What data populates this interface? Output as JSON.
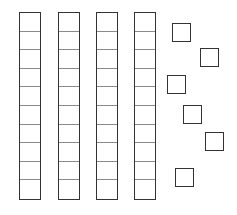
{
  "diagram": {
    "stroke_color": "#333333",
    "divider_color": "#8a8a8a",
    "rods": [
      {
        "name": "ten-rod-1",
        "left": 19,
        "cells": 10
      },
      {
        "name": "ten-rod-2",
        "left": 58,
        "cells": 10
      },
      {
        "name": "ten-rod-3",
        "left": 96,
        "cells": 10
      },
      {
        "name": "ten-rod-4",
        "left": 134,
        "cells": 10
      }
    ],
    "units": [
      {
        "name": "unit-cube-1",
        "left": 172,
        "top": 23
      },
      {
        "name": "unit-cube-2",
        "left": 200,
        "top": 48
      },
      {
        "name": "unit-cube-3",
        "left": 167,
        "top": 75
      },
      {
        "name": "unit-cube-4",
        "left": 183,
        "top": 105
      },
      {
        "name": "unit-cube-5",
        "left": 205,
        "top": 132
      },
      {
        "name": "unit-cube-6",
        "left": 175,
        "top": 168
      }
    ],
    "tens_count": 4,
    "ones_count": 6,
    "represented_value": 46
  }
}
